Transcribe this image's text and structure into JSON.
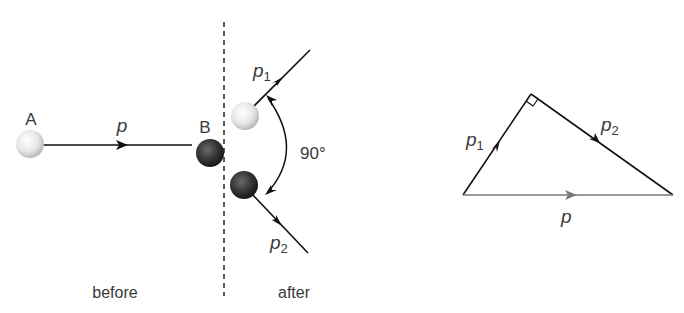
{
  "diagram": {
    "left_panel": {
      "ball_a_label": "A",
      "ball_b_label": "B",
      "incoming_momentum_label": "p",
      "outgoing_momentum_1_label": "p",
      "outgoing_momentum_1_sub": "1",
      "outgoing_momentum_2_label": "p",
      "outgoing_momentum_2_sub": "2",
      "angle_label": "90°",
      "before_label": "before",
      "after_label": "after"
    },
    "right_panel": {
      "side_p1_label": "p",
      "side_p1_sub": "1",
      "side_p2_label": "p",
      "side_p2_sub": "2",
      "side_p_label": "p",
      "right_angle_marker": "right-angle"
    },
    "colors": {
      "ball_light": "#e8e8e8",
      "ball_dark": "#3a3a3a",
      "line": "#111111",
      "resultant_line": "#777777",
      "text": "#3a3a3a"
    }
  }
}
